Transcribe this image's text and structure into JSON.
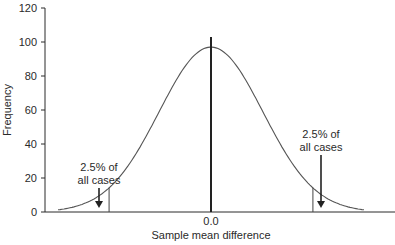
{
  "chart_data": {
    "type": "line",
    "title": "",
    "xlabel": "Sample mean difference",
    "ylabel": "Frequency",
    "ylim": [
      0,
      120
    ],
    "yticks": [
      0,
      20,
      40,
      60,
      80,
      100,
      120
    ],
    "xticks": [
      "0.0"
    ],
    "grid": false,
    "legend": null,
    "series": [
      {
        "name": "Sampling distribution of mean difference (normal curve)",
        "peak_x": 0.0,
        "peak_y": 97,
        "x_sd_units": [
          -3.0,
          -2.5,
          -2.0,
          -1.96,
          -1.5,
          -1.0,
          -0.5,
          0.0,
          0.5,
          1.0,
          1.5,
          1.96,
          2.0,
          2.5,
          3.0
        ],
        "values": [
          1,
          4,
          13,
          14,
          32,
          59,
          86,
          97,
          86,
          59,
          32,
          14,
          13,
          4,
          1
        ]
      }
    ],
    "reference_lines": [
      {
        "name": "center",
        "x": 0.0,
        "y_top": 103
      },
      {
        "name": "lower-cutoff",
        "x_sd_units": -1.96,
        "height": 14
      },
      {
        "name": "upper-cutoff",
        "x_sd_units": 1.96,
        "height": 14
      }
    ],
    "annotations": [
      {
        "side": "left",
        "line1": "2.5% of",
        "line2": "all cases"
      },
      {
        "side": "right",
        "line1": "2.5% of",
        "line2": "all cases"
      }
    ]
  },
  "colors": {
    "axis": "#2a2a2a",
    "curve": "#555555",
    "center_line": "#222222",
    "text": "#2a2a2a",
    "background": "#ffffff"
  }
}
